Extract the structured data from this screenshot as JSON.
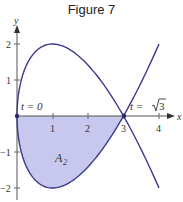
{
  "chart_data": {
    "type": "line",
    "title": "Figure 7",
    "xlabel": "x",
    "ylabel": "y",
    "xlim": [
      0,
      4.3
    ],
    "ylim": [
      -2.2,
      2.3
    ],
    "xticks": [
      "1",
      "2",
      "3",
      "4"
    ],
    "yticks": [
      "2",
      "1",
      "-1",
      "-2"
    ],
    "curve": {
      "parametric": "x = t^2, y = t^3 - 3t",
      "t_range": [
        -2,
        2
      ]
    },
    "points": [
      {
        "x": 0,
        "y": 0,
        "label": "t = 0"
      },
      {
        "x": 3,
        "y": 0,
        "label": "t = √3"
      }
    ],
    "shaded_region": {
      "label": "A2",
      "t_range": [
        0,
        1.732
      ],
      "color": "#c8c8ee"
    },
    "curve_color": "#3a3a8c",
    "grid": false
  },
  "labels": {
    "title": "Figure 7",
    "x_axis": "x",
    "y_axis": "y",
    "t0": "t = 0",
    "tsqrt3_prefix": "t = ",
    "tsqrt3_radicand": "3",
    "area_letter": "A",
    "area_sub": "2",
    "xtick1": "1",
    "xtick2": "2",
    "xtick3": "3",
    "xtick4": "4",
    "ytick2": "2",
    "ytick1": "1",
    "ytickm1": "−1",
    "ytickm2": "−2"
  }
}
